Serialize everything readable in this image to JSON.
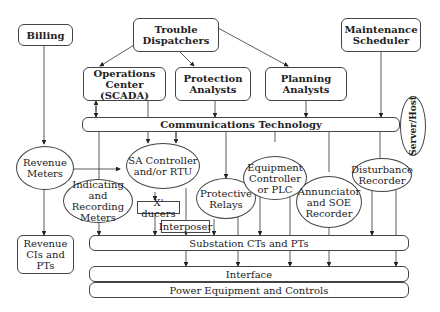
{
  "nodes": {
    "billing": "Billing",
    "trouble_dispatchers": "Trouble Dispatchers",
    "maintenance_scheduler": "Maintenance Scheduler",
    "operations_center": "Operations Center (SCADA)",
    "protection_analysts": "Protection Analysts",
    "planning_analysts": "Planning Analysts",
    "communications_technology": "Communications Technology",
    "server_host": "Server/Host",
    "revenue_meters": "Revenue Meters",
    "sa_controller": "SA Controller and/or RTU",
    "indicating_recording_meters": "Indicating and Recording Meters",
    "xducers": "X' ducers",
    "interposer": "Interposer",
    "protective_relays": "Protective Relays",
    "equipment_controller": "Equipment Controller or PLC",
    "annunciator": "Annunciator and SOE Recorder",
    "disturbance_recorder": "Disturbance Recorder",
    "revenue_cts_pts": "Revenue CIs and PTs",
    "substation_cts_pts": "Substation CTs and PTs",
    "interface": "Interface",
    "power_equipment": "Power Equipment and Controls"
  }
}
